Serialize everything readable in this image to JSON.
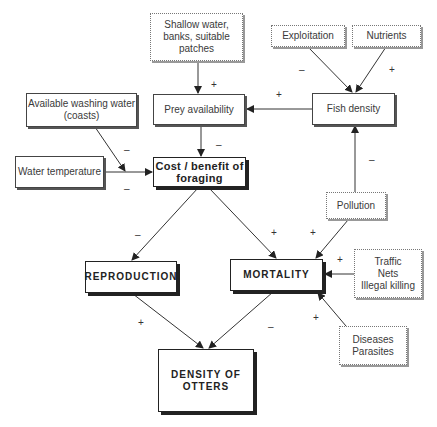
{
  "diagram": {
    "nodes": {
      "shallow_water": "Shallow water,\nbanks, suitable\npatches",
      "exploitation": "Exploitation",
      "nutrients": "Nutrients",
      "washing_water": "Available washing water\n(coasts)",
      "prey_availability": "Prey availability",
      "fish_density": "Fish density",
      "water_temperature": "Water temperature",
      "cost_benefit": "Cost / benefit of\nforaging",
      "pollution": "Pollution",
      "reproduction": "REPRODUCTION",
      "mortality": "MORTALITY",
      "traffic": "Traffic\nNets\nIllegal killing",
      "diseases": "Diseases\nParasites",
      "density_otters": "DENSITY OF\nOTTERS"
    },
    "signs": {
      "shallow_to_prey": "+",
      "exploitation_to_fish": "–",
      "nutrients_to_fish": "+",
      "fish_to_prey": "+",
      "washing_to_cost": "–",
      "temperature_to_cost": "–",
      "prey_to_cost": "–",
      "pollution_to_fish": "–",
      "cost_to_reproduction": "–",
      "cost_to_mortality": "+",
      "pollution_to_mortality": "+",
      "traffic_to_mortality": "+",
      "diseases_to_mortality": "+",
      "reproduction_to_density": "+",
      "mortality_to_density": "–"
    }
  }
}
